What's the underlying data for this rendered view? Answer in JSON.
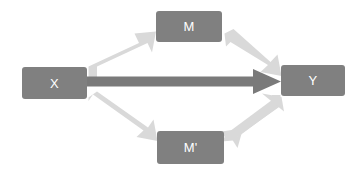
{
  "diagram": {
    "canvas": {
      "width": 355,
      "height": 175,
      "background": "#ffffff"
    },
    "colors": {
      "node_fill": "#808080",
      "node_label": "#ffffff",
      "indirect_arrow": "#d9d9d9",
      "direct_arrow": "#7a7a7a"
    },
    "nodes": [
      {
        "id": "x",
        "label": "X",
        "name": "node-x"
      },
      {
        "id": "m",
        "label": "M",
        "name": "node-m"
      },
      {
        "id": "mp",
        "label": "M'",
        "name": "node-m-prime"
      },
      {
        "id": "y",
        "label": "Y",
        "name": "node-y"
      }
    ],
    "edges": [
      {
        "id": "x_to_m",
        "from": "X",
        "to": "M",
        "style": "light-block-arrow"
      },
      {
        "id": "m_to_y",
        "from": "M",
        "to": "Y",
        "style": "light-block-arrow"
      },
      {
        "id": "x_to_mp",
        "from": "X",
        "to": "M'",
        "style": "light-block-arrow"
      },
      {
        "id": "mp_to_y",
        "from": "M'",
        "to": "Y",
        "style": "light-block-arrow"
      },
      {
        "id": "x_to_y",
        "from": "X",
        "to": "Y",
        "style": "dark-block-arrow"
      }
    ]
  }
}
